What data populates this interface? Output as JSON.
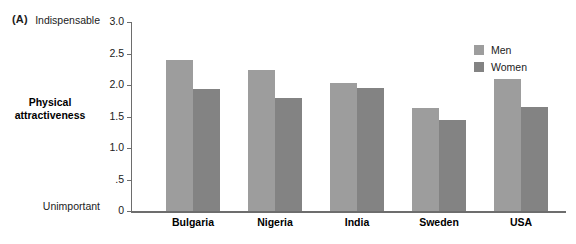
{
  "panel": {
    "letter": "(A)"
  },
  "axis": {
    "title_line1": "Physical",
    "title_line2": "attractiveness",
    "anchor_high": "Indispensable",
    "anchor_low": "Unimportant"
  },
  "legend": {
    "position": "top-right",
    "entries": [
      {
        "label": "Men",
        "color": "#9d9d9d"
      },
      {
        "label": "Women",
        "color": "#838383"
      }
    ]
  },
  "chart_data": {
    "type": "bar",
    "title": "",
    "subtitle": "",
    "xlabel": "",
    "ylabel": "Physical attractiveness",
    "ylim": [
      0,
      3.0
    ],
    "yticks": [
      0,
      0.5,
      1.0,
      1.5,
      2.0,
      2.5,
      3.0
    ],
    "ytick_labels": [
      "0",
      ".5",
      "1.0",
      "1.5",
      "2.0",
      "2.5",
      "3.0"
    ],
    "grid": false,
    "categories": [
      "Bulgaria",
      "Nigeria",
      "India",
      "Sweden",
      "USA"
    ],
    "series": [
      {
        "name": "Men",
        "color": "#9d9d9d",
        "values": [
          2.4,
          2.24,
          2.03,
          1.64,
          2.09
        ]
      },
      {
        "name": "Women",
        "color": "#838383",
        "values": [
          1.94,
          1.8,
          1.96,
          1.44,
          1.65
        ]
      }
    ],
    "annotations": [
      {
        "text": "Indispensable",
        "position": "y-axis-top"
      },
      {
        "text": "Unimportant",
        "position": "y-axis-bottom"
      },
      {
        "text": "(A)",
        "position": "panel-label"
      }
    ]
  }
}
